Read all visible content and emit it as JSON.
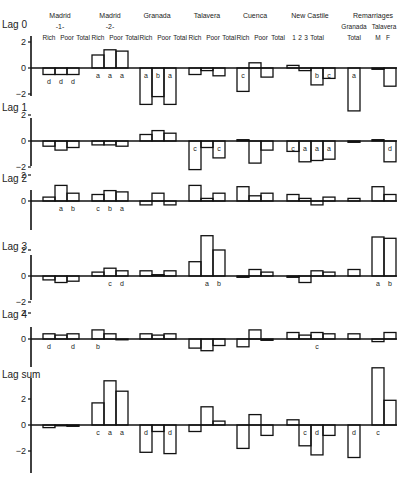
{
  "chart_data": {
    "type": "bar",
    "title": "",
    "xlabel": "",
    "ylabel": "",
    "groups": [
      {
        "name": "Madrid",
        "sub": "-1-",
        "categories": [
          "Rich",
          "Poor",
          "Total"
        ]
      },
      {
        "name": "Madrid",
        "sub": "-2-",
        "categories": [
          "Rich",
          "Poor",
          "Total"
        ]
      },
      {
        "name": "Granada",
        "sub": "",
        "categories": [
          "Rich",
          "Poor",
          "Total"
        ]
      },
      {
        "name": "Talavera",
        "sub": "",
        "categories": [
          "Rich",
          "Poor",
          "Total"
        ]
      },
      {
        "name": "Cuenca",
        "sub": "",
        "categories": [
          "Rich",
          "Poor",
          "Total"
        ]
      },
      {
        "name": "New Castile",
        "sub": "",
        "categories": [
          "1",
          "2",
          "3",
          "Total"
        ]
      },
      {
        "name": "Remarriages",
        "sub": "Granada",
        "categories": [
          "Total"
        ]
      },
      {
        "name": "Remarriages",
        "sub": "Talavera",
        "categories": [
          "M",
          "F"
        ]
      }
    ],
    "categories": [
      "Madrid-1 Rich",
      "Madrid-1 Poor",
      "Madrid-1 Total",
      "Madrid-2 Rich",
      "Madrid-2 Poor",
      "Madrid-2 Total",
      "Granada Rich",
      "Granada Poor",
      "Granada Total",
      "Talavera Rich",
      "Talavera Poor",
      "Talavera Total",
      "Cuenca Rich",
      "Cuenca Poor",
      "Cuenca Total",
      "New Castile 1",
      "New Castile 2",
      "New Castile 3",
      "New Castile Total",
      "Remarriages Granada Total",
      "Remarriages Talavera M",
      "Remarriages Talavera F"
    ],
    "series": [
      {
        "name": "Lag 0",
        "ylim": [
          -2,
          2
        ],
        "ticks": [
          2,
          0,
          -2
        ],
        "values": [
          -0.5,
          -0.5,
          -0.5,
          1.0,
          1.4,
          1.3,
          -2.8,
          -2.2,
          -2.8,
          -0.5,
          -0.2,
          -0.6,
          -1.8,
          0.4,
          -0.7,
          0.2,
          -0.2,
          -1.3,
          -0.8,
          -3.3,
          -0.1,
          -1.4
        ],
        "labels": [
          "d",
          "d",
          "d",
          "a",
          "a",
          "a",
          "a",
          "b",
          "a",
          "",
          "",
          "",
          "c",
          "",
          "",
          "",
          "",
          "b",
          "c",
          "a",
          "",
          ""
        ]
      },
      {
        "name": "Lag 1",
        "ylim": [
          -2,
          2
        ],
        "ticks": [
          2,
          0,
          -2
        ],
        "values": [
          -0.4,
          -0.7,
          -0.5,
          -0.3,
          -0.3,
          -0.4,
          0.5,
          0.8,
          0.6,
          -2.2,
          -0.5,
          -1.3,
          0.1,
          -1.7,
          -0.7,
          -0.8,
          -1.6,
          -1.5,
          -1.4,
          -0.1,
          0.1,
          -1.6
        ],
        "labels": [
          "",
          "",
          "",
          "",
          "",
          "",
          "",
          "",
          "",
          "c",
          "",
          "c",
          "",
          "",
          "",
          "c",
          "a",
          "a",
          "a",
          "",
          "",
          "d"
        ]
      },
      {
        "name": "Lag 2",
        "ylim": [
          -2,
          2
        ],
        "ticks": [
          2,
          0
        ],
        "values": [
          0.3,
          1.2,
          0.6,
          0.5,
          0.8,
          0.7,
          -0.3,
          0.6,
          -0.3,
          1.2,
          0.2,
          0.6,
          1.1,
          0.4,
          0.6,
          0.5,
          0.2,
          -0.3,
          0.3,
          0.2,
          1.1,
          0.5
        ],
        "labels": [
          "",
          "a",
          "b",
          "c",
          "b",
          "a",
          "",
          "",
          "",
          "",
          "",
          "",
          "",
          "",
          "",
          "",
          "",
          "",
          "",
          "",
          "",
          ""
        ]
      },
      {
        "name": "Lag 3",
        "ylim": [
          -2,
          2
        ],
        "ticks": [
          2,
          0,
          -2
        ],
        "values": [
          -0.3,
          -0.5,
          -0.4,
          0.3,
          0.6,
          0.4,
          0.4,
          0.1,
          0.4,
          1.1,
          3.1,
          2.0,
          -0.1,
          0.5,
          0.3,
          -0.1,
          -0.5,
          0.4,
          0.3,
          0.5,
          3.0,
          2.9
        ],
        "labels": [
          "",
          "",
          "",
          "",
          "c",
          "d",
          "",
          "",
          "",
          "",
          "a",
          "b",
          "",
          "",
          "",
          "",
          "",
          "",
          "",
          "",
          "a",
          "b"
        ]
      },
      {
        "name": "Lag 4",
        "ylim": [
          -2,
          2
        ],
        "ticks": [
          2,
          0
        ],
        "values": [
          0.4,
          0.3,
          0.4,
          0.7,
          0.4,
          0.0,
          0.4,
          0.3,
          0.4,
          -0.7,
          -0.9,
          -0.5,
          -0.6,
          0.7,
          -0.1,
          0.5,
          0.3,
          0.5,
          0.4,
          0.4,
          -0.2,
          0.5
        ],
        "labels": [
          "d",
          "",
          "d",
          "b",
          "",
          "",
          "",
          "",
          "",
          "",
          "",
          "",
          "",
          "",
          "",
          "",
          "",
          "c",
          "",
          "",
          "",
          ""
        ]
      },
      {
        "name": "Lag sum",
        "ylim": [
          -2,
          3.5
        ],
        "ticks": [
          2,
          0,
          -2
        ],
        "values": [
          -0.2,
          0.0,
          -0.1,
          1.7,
          3.4,
          2.6,
          -2.1,
          -0.5,
          -2.2,
          -0.5,
          1.4,
          0.3,
          -1.8,
          0.8,
          -0.8,
          0.4,
          -1.6,
          -2.3,
          -0.8,
          -2.5,
          4.4,
          1.9
        ],
        "labels": [
          "",
          "",
          "",
          "c",
          "a",
          "a",
          "d",
          "",
          "d",
          "",
          "",
          "",
          "",
          "",
          "",
          "",
          "c",
          "d",
          "",
          "d",
          "c",
          ""
        ]
      }
    ]
  },
  "header": {
    "groups": [
      {
        "name": "Madrid",
        "sub": "-1-",
        "cols": "Rich  Poor  Total"
      },
      {
        "name": "Madrid",
        "sub": "-2-",
        "cols": "Rich  Poor  Total"
      },
      {
        "name": "Granada",
        "sub": "",
        "cols": "Rich  Poor  Total"
      },
      {
        "name": "Talavera",
        "sub": "",
        "cols": "Rich  Poor  Total"
      },
      {
        "name": "Cuenca",
        "sub": "",
        "cols": "Rich  Poor  Total"
      },
      {
        "name": "New Castile",
        "sub": "",
        "cols": "1 2 3  Total"
      },
      {
        "name": "Remarriages",
        "sub": "",
        "cols": ""
      },
      {
        "name": "Granada",
        "sub": "",
        "cols": "Total"
      },
      {
        "name": "Talavera",
        "sub": "",
        "cols": "M  F"
      }
    ]
  }
}
